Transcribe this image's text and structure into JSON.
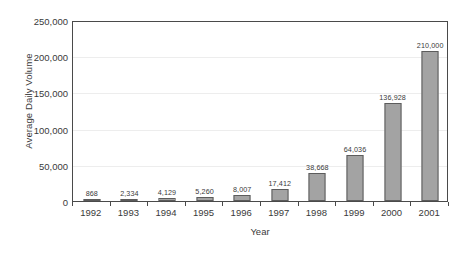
{
  "chart_data": {
    "type": "bar",
    "title": "",
    "xlabel": "Year",
    "ylabel": "Average Daily Volume",
    "categories": [
      "1992",
      "1993",
      "1994",
      "1995",
      "1996",
      "1997",
      "1998",
      "1999",
      "2000",
      "2001"
    ],
    "values": [
      868,
      2334,
      4129,
      5260,
      8007,
      17412,
      38668,
      64036,
      136928,
      210000
    ],
    "data_labels": [
      "868",
      "2,334",
      "4,129",
      "5,260",
      "8,007",
      "17,412",
      "38,668",
      "64,036",
      "136,928",
      "210,000"
    ],
    "ylim": [
      0,
      250000
    ],
    "ytick_values": [
      0,
      50000,
      100000,
      150000,
      200000,
      250000
    ],
    "ytick_labels": [
      "0",
      "50,000",
      "100,000",
      "150,000",
      "200,000",
      "250,000"
    ],
    "grid": true,
    "grid_axis": "y",
    "legend": false,
    "bar_fill_color": "#a3a3a3",
    "bar_border_color": "#5c5c5c",
    "gridline_color": "#ededed",
    "axis_color": "#4a4a4a",
    "text_color": "#3a3a3a",
    "background_color": "#ffffff"
  }
}
